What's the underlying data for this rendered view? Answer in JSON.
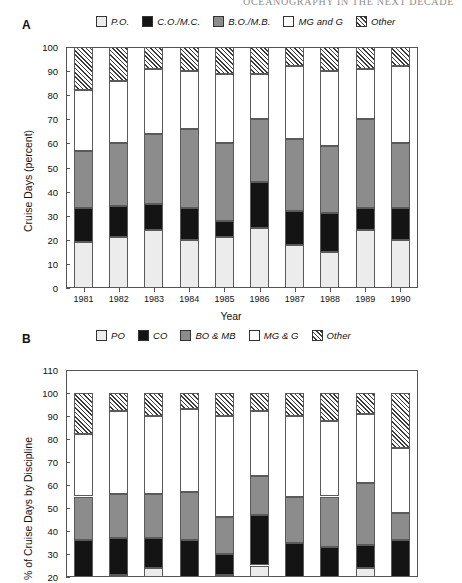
{
  "running_head": "OCEANOGRAPHY IN THE NEXT DECADE",
  "panel_a": {
    "letter": "A",
    "legend": [
      {
        "label": "P.O.",
        "key": "po"
      },
      {
        "label": "C.O./M.C.",
        "key": "co"
      },
      {
        "label": "B.O./M.B.",
        "key": "bo"
      },
      {
        "label": "MG and G",
        "key": "mg"
      },
      {
        "label": "Other",
        "key": "other"
      }
    ]
  },
  "panel_b": {
    "letter": "B",
    "legend": [
      {
        "label": "PO",
        "key": "po"
      },
      {
        "label": "CO",
        "key": "co"
      },
      {
        "label": "BO & MB",
        "key": "bo"
      },
      {
        "label": "MG & G",
        "key": "mg"
      },
      {
        "label": "Other",
        "key": "other"
      }
    ]
  },
  "colors": {
    "po": "#ececec",
    "co": "#141414",
    "bo": "#8c8c8c",
    "mg": "#ffffff",
    "other": "#ffffff",
    "outline": "#5a5a5a",
    "axis": "#555555"
  },
  "chart_data": [
    {
      "type": "bar",
      "stacked": true,
      "panel": "A",
      "title": "",
      "xlabel": "Year",
      "ylabel": "Cruise Days (percent)",
      "ylim": [
        0,
        100
      ],
      "yticks": [
        0,
        10,
        20,
        30,
        40,
        50,
        60,
        70,
        80,
        90,
        100
      ],
      "grid": false,
      "legend_position": "above-plot",
      "categories": [
        "1981",
        "1982",
        "1983",
        "1984",
        "1985",
        "1986",
        "1987",
        "1988",
        "1989",
        "1990"
      ],
      "series": [
        {
          "name": "P.O.",
          "key": "po",
          "values": [
            19,
            21,
            24,
            20,
            21,
            25,
            18,
            15,
            24,
            20
          ]
        },
        {
          "name": "C.O./M.C.",
          "key": "co",
          "values": [
            14,
            13,
            11,
            13,
            7,
            19,
            14,
            16,
            9,
            13
          ]
        },
        {
          "name": "B.O./M.B.",
          "key": "bo",
          "values": [
            24,
            26,
            29,
            33,
            32,
            26,
            30,
            28,
            37,
            27
          ]
        },
        {
          "name": "MG and G",
          "key": "mg",
          "values": [
            25,
            26,
            27,
            24,
            29,
            19,
            30,
            31,
            21,
            32
          ]
        },
        {
          "name": "Other",
          "key": "other",
          "values": [
            18,
            14,
            9,
            10,
            11,
            11,
            8,
            10,
            9,
            8
          ]
        }
      ]
    },
    {
      "type": "bar",
      "stacked": true,
      "panel": "B",
      "title": "",
      "xlabel": "",
      "ylabel": "% of Cruise Days by Discipline",
      "ylim": [
        20,
        110
      ],
      "yticks": [
        20,
        30,
        40,
        50,
        60,
        70,
        80,
        90,
        100,
        110
      ],
      "grid": false,
      "legend_position": "above-plot",
      "clipped_bottom": true,
      "categories": [
        "1981",
        "1982",
        "1983",
        "1984",
        "1985",
        "1986",
        "1987",
        "1988",
        "1989",
        "1990"
      ],
      "series": [
        {
          "name": "PO",
          "key": "po",
          "values": [
            19,
            21,
            24,
            20,
            21,
            25,
            18,
            15,
            24,
            20
          ]
        },
        {
          "name": "CO",
          "key": "co",
          "values": [
            17,
            16,
            13,
            16,
            9,
            22,
            17,
            18,
            10,
            16
          ]
        },
        {
          "name": "BO & MB",
          "key": "bo",
          "values": [
            19,
            19,
            19,
            21,
            16,
            17,
            20,
            22,
            27,
            12
          ]
        },
        {
          "name": "MG & G",
          "key": "mg",
          "values": [
            27,
            36,
            34,
            36,
            44,
            28,
            35,
            33,
            30,
            28
          ]
        },
        {
          "name": "Other",
          "key": "other",
          "values": [
            18,
            8,
            10,
            7,
            10,
            8,
            10,
            12,
            9,
            24
          ]
        }
      ]
    }
  ]
}
